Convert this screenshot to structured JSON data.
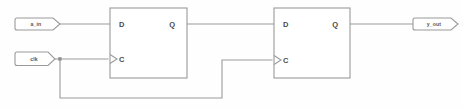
{
  "diagram": {
    "background_color": "#fefefe",
    "line_color": "#9a9a9a",
    "label_color": "#4a4a4a"
  },
  "ports": {
    "inputs": [
      {
        "id": "a_in",
        "label": "a_in",
        "shape": "pennant",
        "x": 15,
        "y": 18
      },
      {
        "id": "clk",
        "label": "clk",
        "shape": "pennant",
        "x": 15,
        "y": 52
      }
    ],
    "outputs": [
      {
        "id": "y_out",
        "label": "y_out",
        "shape": "pennant",
        "x": 415,
        "y": 18
      }
    ]
  },
  "blocks": [
    {
      "id": "dff1",
      "type": "d-flip-flop",
      "x": 110,
      "y": 8,
      "width": 77,
      "height": 70,
      "pins": {
        "d": "D",
        "clock": "C",
        "q": "Q"
      },
      "clock_edge_triggered": true
    },
    {
      "id": "dff2",
      "type": "d-flip-flop",
      "x": 274,
      "y": 8,
      "width": 76,
      "height": 70,
      "pins": {
        "d": "D",
        "clock": "C",
        "q": "Q"
      },
      "clock_edge_triggered": true
    }
  ],
  "nets": [
    {
      "id": "net-a-in-to-d1",
      "from": "a_in",
      "to": "dff1.D"
    },
    {
      "id": "net-clk-to-c1",
      "from": "clk",
      "to": "dff1.C"
    },
    {
      "id": "net-clk-to-c2",
      "from": "clk",
      "to": "dff2.C",
      "routing": "down-right-up"
    },
    {
      "id": "net-q1-to-d2",
      "from": "dff1.Q",
      "to": "dff2.D"
    },
    {
      "id": "net-q2-to-out",
      "from": "dff2.Q",
      "to": "y_out"
    }
  ],
  "junctions": [
    {
      "id": "clk-branch",
      "x": 60,
      "y": 59
    }
  ]
}
